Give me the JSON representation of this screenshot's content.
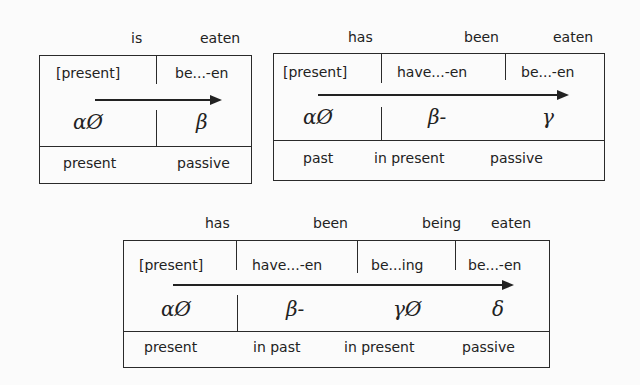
{
  "diagrams": [
    {
      "words": [
        "is",
        "eaten"
      ],
      "morphemes": [
        "[present]",
        "be...-en"
      ],
      "symbols": [
        "αØ",
        "β"
      ],
      "labels": [
        "present",
        "passive"
      ]
    },
    {
      "words": [
        "has",
        "been",
        "eaten"
      ],
      "morphemes": [
        "[present]",
        "have...-en",
        "be...-en"
      ],
      "symbols": [
        "αØ",
        "β-",
        "γ"
      ],
      "labels": [
        "past",
        "in present",
        "passive"
      ]
    },
    {
      "words": [
        "has",
        "been",
        "being",
        "eaten"
      ],
      "morphemes": [
        "[present]",
        "have...-en",
        "be...ing",
        "be...-en"
      ],
      "symbols": [
        "αØ",
        "β-",
        "γØ",
        "δ"
      ],
      "labels": [
        "present",
        "in past",
        "in present",
        "passive"
      ]
    }
  ]
}
